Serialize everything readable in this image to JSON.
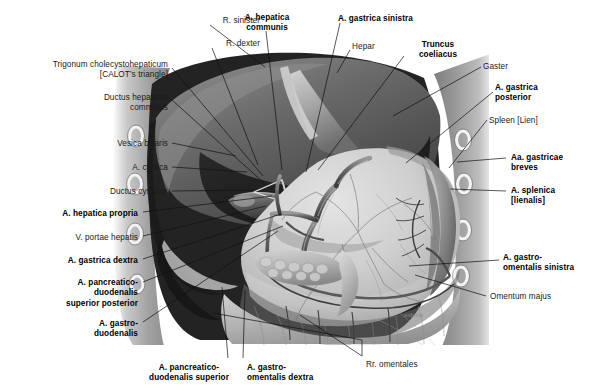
{
  "figure": {
    "background_color": "#ffffff",
    "ink_color": "#111111",
    "watermark": "sideba"
  },
  "labels": [
    {
      "id": "r-sinister",
      "text": "R. sinister",
      "bold": false,
      "align": "right",
      "x": 164,
      "y": 16,
      "w": 96,
      "anchor": [
        265,
        67
      ]
    },
    {
      "id": "a-hepatica-communis",
      "text": "A. hepatica\ncommunis",
      "bold": true,
      "align": "center",
      "x": 228,
      "y": 13,
      "w": 78,
      "anchor": [
        282,
        170
      ]
    },
    {
      "id": "a-gastrica-sinistra",
      "text": "A. gastrica sinistra",
      "bold": true,
      "align": "left",
      "x": 338,
      "y": 14,
      "w": 104,
      "anchor": [
        306,
        172
      ]
    },
    {
      "id": "r-dexter",
      "text": "R. dexter",
      "bold": false,
      "align": "right",
      "x": 168,
      "y": 39,
      "w": 92,
      "anchor": [
        258,
        165
      ]
    },
    {
      "id": "hepar",
      "text": "Hepar",
      "bold": false,
      "align": "left",
      "x": 352,
      "y": 42,
      "w": 50,
      "anchor": [
        337,
        73
      ]
    },
    {
      "id": "truncus-coeliacus",
      "text": "Truncus\ncoeliacus",
      "bold": true,
      "align": "center",
      "x": 406,
      "y": 40,
      "w": 64,
      "anchor": [
        318,
        170
      ]
    },
    {
      "id": "gaster",
      "text": "Gaster",
      "bold": false,
      "align": "left",
      "x": 483,
      "y": 62,
      "w": 48,
      "anchor": [
        393,
        116
      ]
    },
    {
      "id": "trigonum",
      "text": "Trigonum cholecystohepaticum\n[CALOT’s triangle]",
      "bold": false,
      "align": "right",
      "x": 18,
      "y": 60,
      "w": 150,
      "anchor": [
        263,
        176
      ]
    },
    {
      "id": "a-gastrica-posterior",
      "text": "A. gastrica\nposterior",
      "bold": true,
      "align": "left",
      "x": 495,
      "y": 83,
      "w": 70,
      "anchor": [
        406,
        163
      ]
    },
    {
      "id": "ductus-hepaticus",
      "text": "Ductus hepaticus\ncommunis",
      "bold": false,
      "align": "right",
      "x": 34,
      "y": 93,
      "w": 134,
      "anchor": [
        264,
        183
      ]
    },
    {
      "id": "spleen-lien",
      "text": "Spleen [Lien]",
      "bold": false,
      "align": "left",
      "x": 489,
      "y": 116,
      "w": 72,
      "anchor": [
        449,
        168
      ]
    },
    {
      "id": "vesica-biliaris",
      "text": "Vesica biliaris",
      "bold": false,
      "align": "right",
      "x": 55,
      "y": 139,
      "w": 113,
      "anchor": [
        236,
        156
      ]
    },
    {
      "id": "a-cystica",
      "text": "A. cystica",
      "bold": false,
      "align": "right",
      "x": 78,
      "y": 163,
      "w": 90,
      "anchor": [
        247,
        172
      ]
    },
    {
      "id": "aa-gastricae-breves",
      "text": "Aa. gastricae\nbreves",
      "bold": true,
      "align": "left",
      "x": 511,
      "y": 153,
      "w": 80,
      "anchor": [
        457,
        162
      ]
    },
    {
      "id": "ductus-cysticus",
      "text": "Ductus cysticus",
      "bold": false,
      "align": "right",
      "x": 45,
      "y": 187,
      "w": 123,
      "anchor": [
        254,
        190
      ]
    },
    {
      "id": "a-splenica",
      "text": "A. splenica\n[lienalis]",
      "bold": true,
      "align": "left",
      "x": 511,
      "y": 186,
      "w": 72,
      "anchor": [
        450,
        189
      ]
    },
    {
      "id": "a-hepatica-propria",
      "text": "A. hepatica propria",
      "bold": true,
      "align": "right",
      "x": 24,
      "y": 209,
      "w": 114,
      "anchor": [
        272,
        196
      ]
    },
    {
      "id": "v-portae-hepatis",
      "text": "V. portae hepatis",
      "bold": false,
      "align": "right",
      "x": 38,
      "y": 233,
      "w": 100,
      "anchor": [
        266,
        206
      ]
    },
    {
      "id": "a-gastrica-dextra",
      "text": "A. gastrica dextra",
      "bold": true,
      "align": "right",
      "x": 26,
      "y": 256,
      "w": 112,
      "anchor": [
        281,
        214
      ]
    },
    {
      "id": "a-pancreaticoduodenalis-sp",
      "text": "A. pancreatico-\nduodenalis\nsuperior posterior",
      "bold": true,
      "align": "right",
      "x": 32,
      "y": 278,
      "w": 106,
      "anchor": [
        283,
        226
      ]
    },
    {
      "id": "a-gastroduodenalis",
      "text": "A. gastro-\nduodenalis",
      "bold": true,
      "align": "right",
      "x": 62,
      "y": 319,
      "w": 76,
      "anchor": [
        278,
        231
      ]
    },
    {
      "id": "a-gastro-omentalis-sinistra",
      "text": "A. gastro-\nomentalis sinistra",
      "bold": true,
      "align": "left",
      "x": 503,
      "y": 253,
      "w": 94,
      "anchor": [
        409,
        266
      ]
    },
    {
      "id": "omentum-majus",
      "text": "Omentum majus",
      "bold": false,
      "align": "left",
      "x": 490,
      "y": 292,
      "w": 86,
      "anchor": [
        415,
        275
      ]
    },
    {
      "id": "a-pancreaticoduodenalis-superior",
      "text": "A. pancreatico-\nduodenalis superior",
      "bold": true,
      "align": "center",
      "x": 135,
      "y": 363,
      "w": 108,
      "anchor": [
        222,
        287
      ]
    },
    {
      "id": "a-gastro-omentalis-dextra",
      "text": "A. gastro-\nomentalis dextra",
      "bold": true,
      "align": "left",
      "x": 247,
      "y": 363,
      "w": 90,
      "anchor": [
        245,
        290
      ]
    },
    {
      "id": "rr-omentales",
      "text": "Rr. omentales",
      "bold": false,
      "align": "left",
      "x": 366,
      "y": 360,
      "w": 72,
      "anchor": [
        300,
        315
      ]
    }
  ],
  "leaders": [
    {
      "id": "leader-r-sinister",
      "points": "210,25 265,67"
    },
    {
      "id": "leader-a-hep-communis",
      "points": "266,31 282,170"
    },
    {
      "id": "leader-a-gastrica-sin",
      "points": "340,23 306,172"
    },
    {
      "id": "leader-r-dexter",
      "points": "212,48 258,165"
    },
    {
      "id": "leader-hepar",
      "points": "350,50 337,73"
    },
    {
      "id": "leader-truncus",
      "points": "404,56 318,170"
    },
    {
      "id": "leader-gaster",
      "points": "481,67 393,116"
    },
    {
      "id": "leader-trigonum",
      "points": "172,68 263,176"
    },
    {
      "id": "leader-a-gastrica-post",
      "points": "493,92 406,163"
    },
    {
      "id": "leader-ductus-hepaticus",
      "points": "172,100 264,183"
    },
    {
      "id": "leader-spleen",
      "points": "487,120 449,168"
    },
    {
      "id": "leader-vesica",
      "points": "172,143 236,156"
    },
    {
      "id": "leader-a-cystica",
      "points": "172,167 247,172"
    },
    {
      "id": "leader-aa-gastricae",
      "points": "506,158 457,162"
    },
    {
      "id": "leader-ductus-cysticus",
      "points": "172,191 254,190"
    },
    {
      "id": "leader-a-splenica",
      "points": "506,191 450,189"
    },
    {
      "id": "leader-a-hep-propria",
      "points": "143,212 272,196"
    },
    {
      "id": "leader-v-portae",
      "points": "143,236 266,206"
    },
    {
      "id": "leader-a-gastrica-dex",
      "points": "143,259 281,214"
    },
    {
      "id": "leader-a-pd-sp",
      "points": "143,282 283,226"
    },
    {
      "id": "leader-a-gastroduod",
      "points": "143,322 278,231"
    },
    {
      "id": "leader-a-go-sinistra",
      "points": "499,260 409,266"
    },
    {
      "id": "leader-omentum-majus",
      "points": "486,296 415,275"
    },
    {
      "id": "leader-a-pd-sup",
      "points": "228,358 222,287"
    },
    {
      "id": "leader-a-go-dextra",
      "points": "243,358 245,290"
    },
    {
      "id": "leader-rr-omentales-1",
      "points": "362,356 300,315"
    },
    {
      "id": "leader-rr-omentales-2",
      "points": "362,356 362,340 213,313"
    }
  ]
}
